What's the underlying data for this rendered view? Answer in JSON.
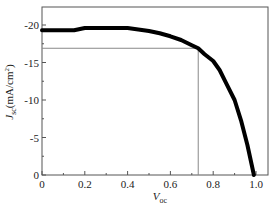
{
  "chart_data": {
    "type": "line",
    "title": "",
    "xlabel": "V",
    "xlabel_sub": "oc",
    "ylabel": "J",
    "ylabel_sub": "sc",
    "ylabel_unit": "(mA/cm",
    "ylabel_unit_sup": "2",
    "ylabel_unit_close": ")",
    "xlim": [
      0,
      1.05
    ],
    "ylim": [
      0,
      -23
    ],
    "x_ticks": [
      0,
      0.2,
      0.4,
      0.6,
      0.8,
      1.0
    ],
    "x_tick_labels": [
      "0",
      "0.2",
      "0.4",
      "0.6",
      "0.8",
      "1.0"
    ],
    "y_ticks": [
      0,
      -5,
      -10,
      -15,
      -20
    ],
    "y_tick_labels": [
      "0",
      "-5",
      "-10",
      "-15",
      "-20"
    ],
    "grid": false,
    "legend": null,
    "series": [
      {
        "name": "J-V curve",
        "x": [
          0,
          0.05,
          0.1,
          0.15,
          0.2,
          0.3,
          0.4,
          0.45,
          0.5,
          0.55,
          0.6,
          0.65,
          0.7,
          0.73,
          0.76,
          0.8,
          0.83,
          0.86,
          0.9,
          0.93,
          0.96,
          0.99
        ],
        "y": [
          -19.3,
          -19.3,
          -19.3,
          -19.3,
          -19.6,
          -19.6,
          -19.6,
          -19.4,
          -19.2,
          -18.9,
          -18.5,
          -18.0,
          -17.3,
          -16.9,
          -16.1,
          -15.2,
          -14.0,
          -12.3,
          -10.0,
          -7.3,
          -4.0,
          0.0
        ]
      }
    ],
    "annotations": [
      {
        "type": "vline",
        "x": 0.73,
        "description": "max power point voltage"
      },
      {
        "type": "hline",
        "y": -16.9,
        "description": "max power point current density"
      }
    ]
  }
}
